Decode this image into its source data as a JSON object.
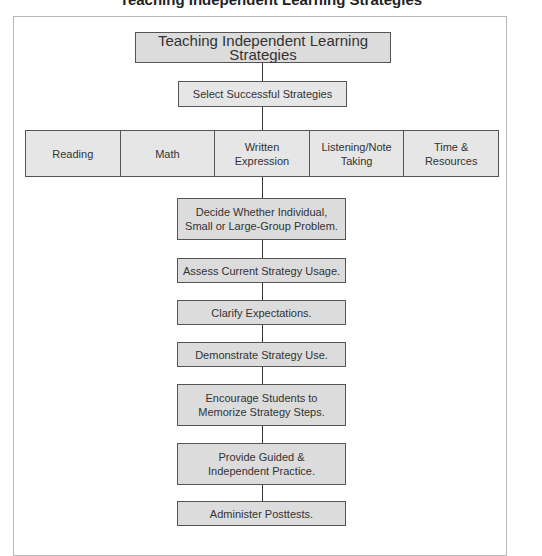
{
  "figure": {
    "cut_off_title": "Teaching Independent Learning Strategies"
  },
  "diagram": {
    "root": "Teaching Independent Learning Strategies",
    "select": "Select Successful Strategies",
    "categories": [
      {
        "label": "Reading"
      },
      {
        "label": "Math"
      },
      {
        "label": "Written Expression"
      },
      {
        "label": "Listening/Note Taking"
      },
      {
        "label": "Time & Resources"
      }
    ],
    "steps": [
      {
        "label": "Decide Whether Individual, Small or Large-Group Problem."
      },
      {
        "label": "Assess Current Strategy Usage."
      },
      {
        "label": "Clarify Expectations."
      },
      {
        "label": "Demonstrate Strategy Use."
      },
      {
        "label": "Encourage Students to Memorize Strategy Steps."
      },
      {
        "label": "Provide Guided & Independent Practice."
      },
      {
        "label": "Administer Posttests."
      }
    ]
  },
  "colors": {
    "box_fill": "#dcdcdc",
    "box_border": "#555555",
    "frame_border": "#b8b8b8"
  }
}
